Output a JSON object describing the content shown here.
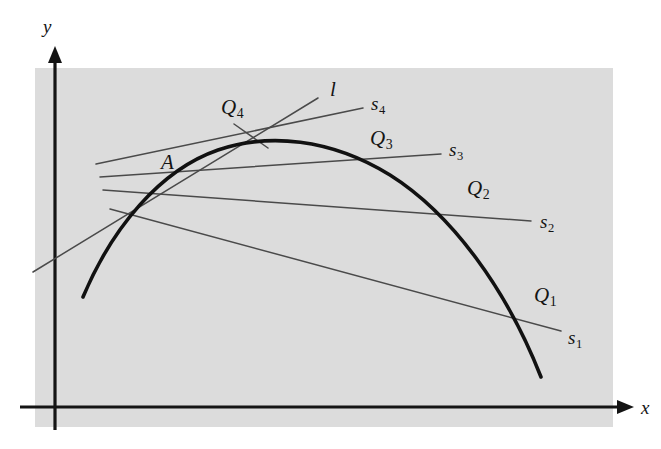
{
  "figure": {
    "domain": "Diagram",
    "width": 661,
    "height": 449,
    "background_color": "#ffffff",
    "panel_color": "#dcdcdc",
    "curve_color": "#111111",
    "line_color": "#4a4a4a",
    "axis_color": "#141414"
  },
  "axes": {
    "x_label": "x",
    "y_label": "y",
    "x_axis_y": 407,
    "y_axis_x": 55,
    "x_arrow_tip_x": 630,
    "y_arrow_tip_y": 50
  },
  "panel": {
    "left": 35,
    "top": 68,
    "right": 613,
    "bottom": 427
  },
  "curve": {
    "name": "graph-curve",
    "path": "M 83 297 C 112 228 160 170 218 150 C 268 133 330 138 390 175 C 452 214 507 290 541 377",
    "left_end": [
      83,
      297
    ],
    "apex": [
      300,
      145
    ],
    "right_end": [
      541,
      377
    ],
    "stroke_width": 3.6
  },
  "point_A": {
    "label": "A",
    "x": 175,
    "y": 182,
    "label_x": 161,
    "label_y": 152
  },
  "tangent": {
    "id": "tangent-line-l",
    "label": "l",
    "label_x": 330,
    "label_y": 79,
    "x1": 33,
    "y1": 272,
    "x2": 318,
    "y2": 98,
    "leader": {
      "from_x": 234,
      "from_y": 124,
      "to_x": 268,
      "to_y": 148
    },
    "leader_label": "Q",
    "leader_sub": "4"
  },
  "secants": [
    {
      "id": "secant-s1",
      "label": "s",
      "sub": "1",
      "label_x": 568,
      "label_y": 328,
      "point_label": "Q",
      "point_sub": "1",
      "point_label_x": 534,
      "point_label_y": 285,
      "x1": 110,
      "y1": 209,
      "x2": 561,
      "y2": 331,
      "qx": 512,
      "qy": 322
    },
    {
      "id": "secant-s2",
      "label": "s",
      "sub": "2",
      "label_x": 540,
      "label_y": 212,
      "point_label": "Q",
      "point_sub": "2",
      "point_label_x": 467,
      "point_label_y": 178,
      "x1": 103,
      "y1": 190,
      "x2": 531,
      "y2": 221,
      "qx": 462,
      "qy": 207
    },
    {
      "id": "secant-s3",
      "label": "s",
      "sub": "3",
      "label_x": 449,
      "label_y": 140,
      "point_label": "Q",
      "point_sub": "3",
      "point_label_x": 370,
      "point_label_y": 128,
      "x1": 100,
      "y1": 177,
      "x2": 441,
      "y2": 154,
      "qx": 360,
      "qy": 163
    },
    {
      "id": "secant-s4",
      "label": "s",
      "sub": "4",
      "label_x": 371,
      "label_y": 94,
      "point_label": "Q",
      "point_sub": "4",
      "point_label_x": 221,
      "point_label_y": 97,
      "x1": 96,
      "y1": 164,
      "x2": 363,
      "y2": 108,
      "qx": 295,
      "qy": 146
    }
  ]
}
